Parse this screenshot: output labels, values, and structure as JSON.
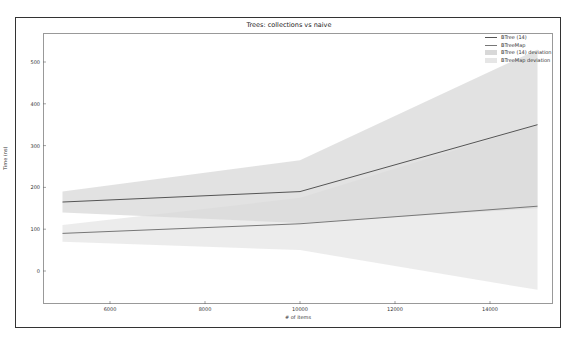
{
  "chart_data": {
    "type": "line",
    "title": "Trees: collections vs naive",
    "xlabel": "# of items",
    "ylabel": "Time (ns)",
    "x": [
      5000,
      10000,
      15000
    ],
    "xticks": [
      "6000",
      "8000",
      "10000",
      "12000",
      "14000"
    ],
    "yticks": [
      "500",
      "400",
      "300",
      "200",
      "100",
      "0"
    ],
    "xlim": [
      4100,
      15400
    ],
    "ylim": [
      -80,
      560
    ],
    "grid": false,
    "legend_position": "upper right",
    "series": [
      {
        "name": "BTree (14)",
        "values": [
          165,
          190,
          350
        ],
        "color": "#555555"
      },
      {
        "name": "BTreeMap",
        "values": [
          90,
          113,
          155
        ],
        "color": "#777777"
      }
    ],
    "bands": [
      {
        "name": "BTree (14) deviation",
        "upper": [
          190,
          265,
          530
        ],
        "lower": [
          140,
          115,
          150
        ],
        "color": "#d8d8d8"
      },
      {
        "name": "BTreeMap deviation",
        "upper": [
          110,
          175,
          350
        ],
        "lower": [
          70,
          50,
          -45
        ],
        "color": "#e6e6e6"
      }
    ]
  },
  "legend": {
    "items": [
      {
        "label": "BTree (14)",
        "kind": "line",
        "color": "#555555"
      },
      {
        "label": "BTreeMap",
        "kind": "line",
        "color": "#777777"
      },
      {
        "label": "BTree (14) deviation",
        "kind": "patch",
        "color": "#d8d8d8"
      },
      {
        "label": "BTreeMap deviation",
        "kind": "patch",
        "color": "#e6e6e6"
      }
    ]
  }
}
